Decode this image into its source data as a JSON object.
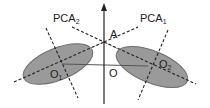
{
  "diagram": {
    "colors": {
      "ellipse_fill": "#9a9a9a",
      "ellipse_stroke": "#6e6e6e",
      "axis": "#222222",
      "dashed": "#222222",
      "connector": "#b8b8b8"
    },
    "labels": {
      "pca2": {
        "base": "PCA",
        "sub": "2"
      },
      "pca1": {
        "base": "PCA",
        "sub": "1"
      },
      "a": "A",
      "o": "O",
      "o1": {
        "base": "O",
        "sub": "1"
      },
      "o2": {
        "base": "O",
        "sub": "2"
      }
    },
    "elements": {
      "vertical_axis": "arrow-up",
      "horizontal_axis": "line",
      "left_ellipse": "cluster-1",
      "right_ellipse": "cluster-2"
    }
  }
}
